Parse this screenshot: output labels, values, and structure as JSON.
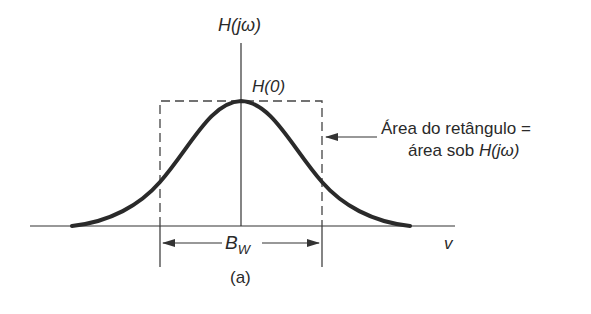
{
  "diagram": {
    "y_axis_label_main": "H",
    "y_axis_label_arg": "(jω)",
    "peak_label": "H(0)",
    "annotation_line1": "Área do retângulo =",
    "annotation_line2_text": "área sob ",
    "annotation_line2_math": "H(jω)",
    "bandwidth_label_main": "B",
    "bandwidth_label_sub": "W",
    "x_axis_label": "v",
    "caption": "(a)",
    "colors": {
      "curve": "#2a2a2a",
      "axes": "#333333",
      "dashed": "#444444",
      "background": "#ffffff"
    }
  }
}
